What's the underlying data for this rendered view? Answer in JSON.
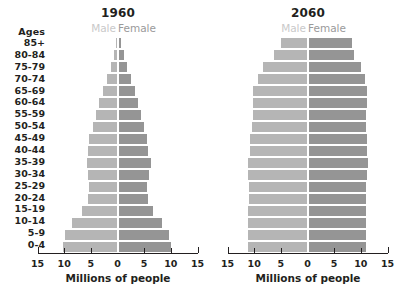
{
  "axis": {
    "x_label": "Millions of people",
    "tick_labels": [
      "15",
      "10",
      "5",
      "0",
      "5",
      "10",
      "15"
    ],
    "tick_values": [
      -15,
      -10,
      -5,
      0,
      5,
      10,
      15
    ],
    "xlim": [
      -15,
      15
    ]
  },
  "ages_header": "Ages",
  "age_groups": [
    "85+",
    "80-84",
    "75-79",
    "70-74",
    "65-69",
    "60-64",
    "55-59",
    "50-54",
    "45-49",
    "40-44",
    "35-39",
    "30-34",
    "25-29",
    "20-24",
    "15-19",
    "10-14",
    "5-9",
    "0-4"
  ],
  "legend": {
    "male": "Male",
    "female": "Female"
  },
  "colors": {
    "male": "#b5b5b5",
    "female": "#959595",
    "male_legend_text": "#c9c9c9",
    "female_legend_text": "#9a9a9a",
    "text": "#231f20",
    "background": "#ffffff"
  },
  "panels": [
    {
      "title": "1960"
    },
    {
      "title": "2060"
    }
  ],
  "chart_data": [
    {
      "type": "bar",
      "title": "1960",
      "subtype": "population-pyramid",
      "xlabel": "Millions of people",
      "ylabel": "Ages",
      "xlim": [
        -15,
        15
      ],
      "xticks": [
        -15,
        -10,
        -5,
        0,
        5,
        10,
        15
      ],
      "xticklabels": [
        "15",
        "10",
        "5",
        "0",
        "5",
        "10",
        "15"
      ],
      "grid": false,
      "legend": [
        "Male",
        "Female"
      ],
      "legend_position": "top",
      "categories": [
        "85+",
        "80-84",
        "75-79",
        "70-74",
        "65-69",
        "60-64",
        "55-59",
        "50-54",
        "45-49",
        "40-44",
        "35-39",
        "30-34",
        "25-29",
        "20-24",
        "15-19",
        "10-14",
        "5-9",
        "0-4"
      ],
      "series": [
        {
          "name": "Male",
          "side": "left",
          "values": [
            0.3,
            0.7,
            1.2,
            1.9,
            2.7,
            3.4,
            4.0,
            4.6,
            5.3,
            5.5,
            5.8,
            5.5,
            5.3,
            5.5,
            6.6,
            8.5,
            9.8,
            10.3
          ]
        },
        {
          "name": "Female",
          "side": "right",
          "values": [
            0.5,
            1.0,
            1.6,
            2.3,
            3.1,
            3.7,
            4.2,
            4.7,
            5.4,
            5.6,
            6.0,
            5.7,
            5.4,
            5.6,
            6.5,
            8.2,
            9.5,
            9.9
          ]
        }
      ]
    },
    {
      "type": "bar",
      "title": "2060",
      "subtype": "population-pyramid",
      "xlabel": "Millions of people",
      "ylabel": "Ages",
      "xlim": [
        -15,
        15
      ],
      "xticks": [
        -15,
        -10,
        -5,
        0,
        5,
        10,
        15
      ],
      "xticklabels": [
        "15",
        "10",
        "5",
        "0",
        "5",
        "10",
        "15"
      ],
      "grid": false,
      "legend": [
        "Male",
        "Female"
      ],
      "legend_position": "top",
      "categories": [
        "85+",
        "80-84",
        "75-79",
        "70-74",
        "65-69",
        "60-64",
        "55-59",
        "50-54",
        "45-49",
        "40-44",
        "35-39",
        "30-34",
        "25-29",
        "20-24",
        "15-19",
        "10-14",
        "5-9",
        "0-4"
      ],
      "series": [
        {
          "name": "Male",
          "side": "left",
          "values": [
            5.0,
            6.2,
            8.3,
            9.3,
            10.2,
            10.2,
            10.3,
            10.4,
            10.7,
            10.8,
            11.1,
            11.1,
            11.0,
            11.0,
            11.1,
            11.2,
            11.2,
            11.1
          ]
        },
        {
          "name": "Female",
          "side": "right",
          "values": [
            8.1,
            8.5,
            9.9,
            10.5,
            11.0,
            10.9,
            10.8,
            10.8,
            10.9,
            10.9,
            11.1,
            11.0,
            10.8,
            10.7,
            10.7,
            10.8,
            10.8,
            10.7
          ]
        }
      ]
    }
  ]
}
